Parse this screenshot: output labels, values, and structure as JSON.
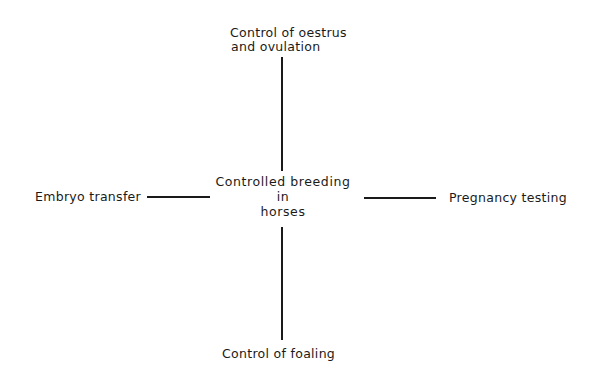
{
  "diagram": {
    "center": {
      "lines": [
        "Controlled breeding",
        "in",
        "horses"
      ]
    },
    "nodes": {
      "top": {
        "lines": [
          "Control of oestrus",
          "and ovulation"
        ]
      },
      "left": {
        "label": "Embryo transfer"
      },
      "right": {
        "label": "Pregnancy testing"
      },
      "bottom": {
        "label": "Control of foaling"
      }
    },
    "edges": [
      {
        "from": "center",
        "to": "top"
      },
      {
        "from": "center",
        "to": "left"
      },
      {
        "from": "center",
        "to": "right"
      },
      {
        "from": "center",
        "to": "bottom"
      }
    ],
    "line_color": "#1a1a1a"
  }
}
